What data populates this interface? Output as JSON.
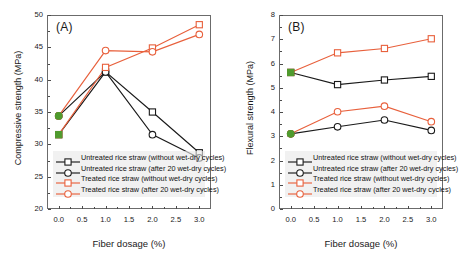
{
  "figure": {
    "panels": [
      {
        "tag": "(A)",
        "ylabel": "Compressive strength (MPa)",
        "xlabel": "Fiber dosage (%)"
      },
      {
        "tag": "(B)",
        "ylabel": "Flexural strength (MPa)",
        "xlabel": "Fiber dosage (%)"
      }
    ],
    "legend_labels": [
      "Untreated rice straw (without wet-dry cycles)",
      "Untreated rice straw (after 20 wet-dry cycles)",
      "Treated rice straw (without wet-dry cycles)",
      "Treated rice straw (after 20 wet-dry cycles)"
    ]
  },
  "colors": {
    "black": "#1a1a1a",
    "red": "#e8603c",
    "green": "#4f9b2e",
    "axis": "#6b6b6b",
    "legend_bg": "#e8e8e8"
  },
  "chart_data": [
    {
      "type": "line",
      "title": "(A)",
      "xlabel": "Fiber dosage (%)",
      "ylabel": "Compressive strength (MPa)",
      "xlim": [
        -0.25,
        3.25
      ],
      "ylim": [
        20,
        50
      ],
      "xticks": [
        0.0,
        0.5,
        1.0,
        1.5,
        2.0,
        2.5,
        3.0
      ],
      "xticklabels": [
        "0.0",
        "0.5",
        "1.0",
        "1.5",
        "2.0",
        "2.5",
        "3.0"
      ],
      "yticks": [
        20,
        25,
        30,
        35,
        40,
        45,
        50
      ],
      "yticklabels": [
        "20",
        "25",
        "30",
        "35",
        "40",
        "45",
        "50"
      ],
      "grid": false,
      "legend_position": "lower-left",
      "series": [
        {
          "name": "Untreated rice straw (without wet-dry cycles)",
          "color": "#1a1a1a",
          "marker": "square",
          "x": [
            0.0,
            1.0,
            2.0,
            3.0
          ],
          "values": [
            31.5,
            41.2,
            35.0,
            28.7
          ]
        },
        {
          "name": "Untreated rice straw (after 20 wet-dry cycles)",
          "color": "#1a1a1a",
          "marker": "circle",
          "x": [
            0.0,
            1.0,
            2.0,
            3.0
          ],
          "values": [
            34.4,
            41.2,
            31.5,
            27.9
          ]
        },
        {
          "name": "Treated rice straw (without wet-dry cycles)",
          "color": "#e8603c",
          "marker": "square",
          "x": [
            0.0,
            1.0,
            2.0,
            3.0
          ],
          "values": [
            31.5,
            41.9,
            44.9,
            48.5
          ]
        },
        {
          "name": "Treated rice straw (after 20 wet-dry cycles)",
          "color": "#e8603c",
          "marker": "circle",
          "x": [
            0.0,
            1.0,
            2.0,
            3.0
          ],
          "values": [
            34.4,
            44.5,
            44.3,
            47.0
          ]
        }
      ],
      "highlight_points": [
        {
          "x": 0.0,
          "y": 34.4,
          "marker": "circle",
          "color": "#4f9b2e"
        },
        {
          "x": 0.0,
          "y": 31.5,
          "marker": "square",
          "color": "#4f9b2e"
        }
      ]
    },
    {
      "type": "line",
      "title": "(B)",
      "xlabel": "Fiber dosage (%)",
      "ylabel": "Flexural strength (MPa)",
      "xlim": [
        -0.25,
        3.25
      ],
      "ylim": [
        0,
        8
      ],
      "xticks": [
        0.0,
        0.5,
        1.0,
        1.5,
        2.0,
        2.5,
        3.0
      ],
      "xticklabels": [
        "0.0",
        "0.5",
        "1.0",
        "1.5",
        "2.0",
        "2.5",
        "3.0"
      ],
      "yticks": [
        0,
        1,
        2,
        3,
        4,
        5,
        6,
        7,
        8
      ],
      "yticklabels": [
        "0",
        "1",
        "2",
        "3",
        "4",
        "5",
        "6",
        "7",
        "8"
      ],
      "grid": false,
      "legend_position": "lower-left",
      "series": [
        {
          "name": "Untreated rice straw (without wet-dry cycles)",
          "color": "#1a1a1a",
          "marker": "square",
          "x": [
            0.0,
            1.0,
            2.0,
            3.0
          ],
          "values": [
            5.63,
            5.13,
            5.32,
            5.47
          ]
        },
        {
          "name": "Untreated rice straw (after 20 wet-dry cycles)",
          "color": "#1a1a1a",
          "marker": "circle",
          "x": [
            0.0,
            1.0,
            2.0,
            3.0
          ],
          "values": [
            3.1,
            3.39,
            3.67,
            3.24
          ]
        },
        {
          "name": "Treated rice straw (without wet-dry cycles)",
          "color": "#e8603c",
          "marker": "square",
          "x": [
            0.0,
            1.0,
            2.0,
            3.0
          ],
          "values": [
            5.63,
            6.44,
            6.62,
            7.02
          ]
        },
        {
          "name": "Treated rice straw (after 20 wet-dry cycles)",
          "color": "#e8603c",
          "marker": "circle",
          "x": [
            0.0,
            1.0,
            2.0,
            3.0
          ],
          "values": [
            3.1,
            4.01,
            4.24,
            3.6
          ]
        }
      ],
      "highlight_points": [
        {
          "x": 0.0,
          "y": 5.63,
          "marker": "square",
          "color": "#4f9b2e"
        },
        {
          "x": 0.0,
          "y": 3.1,
          "marker": "circle",
          "color": "#4f9b2e"
        }
      ]
    }
  ]
}
